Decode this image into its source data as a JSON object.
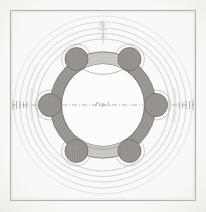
{
  "plate": {
    "kind": "antique-engraving",
    "subject": "Circular fortified enceinte plan with six bastions",
    "width": 206,
    "height": 212,
    "paper_color": "#fbfaf8",
    "ink_color": "#8e8c88",
    "ink_dark": "#6e6b67",
    "frame": {
      "label": "plate border",
      "x": 10.5,
      "y": 10.5,
      "width": 185,
      "height": 190,
      "stroke": "#a8a6a2",
      "stroke_width": 1.1
    },
    "geometry": {
      "center_x": 103,
      "center_y": 105,
      "rampart_outer_radius": 53,
      "rampart_inner_radius": 41.5,
      "bastion_orbit_radius": 53,
      "bastion_radius": 11.5,
      "bastion_count": 6,
      "bastion_angles_deg": [
        -60,
        -120,
        180,
        120,
        60,
        0
      ]
    },
    "rampart": {
      "label": "rampart ring",
      "fill": "#9a9793",
      "hatch_color": "#6f6c68",
      "stroke": "#6a6763"
    },
    "curtain_band": {
      "label": "stippled curtain band",
      "fill": "#cfccc7",
      "stipple_color": "#8b8884",
      "segments": [
        {
          "name": "north-curtain",
          "start_deg": -120,
          "end_deg": -60
        },
        {
          "name": "south-curtain",
          "start_deg": 60,
          "end_deg": 120
        }
      ]
    },
    "bastion": {
      "label": "bastion tower",
      "fill": "#9c9995",
      "stipple_color": "#5f5c58",
      "stroke": "#6b6864",
      "collar_stroke": "#bdbab6"
    },
    "covered_way": {
      "label": "covered way and glacis arcs",
      "stroke": "#b7b4b0",
      "radii": [
        66,
        72,
        78,
        84,
        90
      ]
    },
    "inner_field": {
      "label": "inner parade ground",
      "fill": "#fdfcfa"
    },
    "axis": {
      "label": "horizontal survey axis",
      "style": "dash-dot",
      "stroke": "#9b9894",
      "x1": 12,
      "x2": 194,
      "y": 105
    },
    "tick_marks": {
      "label": "scale tick marks",
      "stroke": "#97948f",
      "left_x": 14,
      "right_x": 192,
      "count_per_side": 5
    },
    "annotations": [
      {
        "name": "top-annotation",
        "text": "fig.",
        "x": 103,
        "y": 26,
        "font_size": 5.5,
        "rotate": 0,
        "opacity": 0.5
      },
      {
        "name": "top-leader-note",
        "text": "a",
        "x": 103,
        "y": 36,
        "font_size": 5,
        "rotate": 0,
        "opacity": 0.45
      },
      {
        "name": "center-label",
        "text": "Fig. I.",
        "x": 103,
        "y": 106,
        "font_size": 6.5,
        "rotate": 0,
        "opacity": 0.55
      },
      {
        "name": "upper-right-note",
        "text": "b c",
        "x": 127,
        "y": 72,
        "font_size": 5,
        "rotate": -18,
        "opacity": 0.45
      }
    ]
  }
}
